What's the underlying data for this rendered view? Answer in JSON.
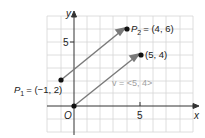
{
  "diagram": {
    "axes": {
      "x_label": "x",
      "y_label": "y",
      "origin_label": "O",
      "x_tick": "5",
      "y_tick": "5"
    },
    "points": {
      "p1": {
        "name": "P",
        "sub": "1",
        "value": "= (−1, 2)",
        "x": -1,
        "y": 2
      },
      "p2": {
        "name": "P",
        "sub": "2",
        "value": "= (4, 6)",
        "x": 4,
        "y": 6
      },
      "origin": {
        "x": 0,
        "y": 0
      },
      "end": {
        "label": "(5, 4)",
        "x": 5,
        "y": 4
      }
    },
    "vector_label": "v = <5, 4>",
    "colors": {
      "grid": "#d0d0d0",
      "arrow": "#7a7a7a",
      "axis": "#333333",
      "vector_label": "#a0a0a0"
    }
  }
}
